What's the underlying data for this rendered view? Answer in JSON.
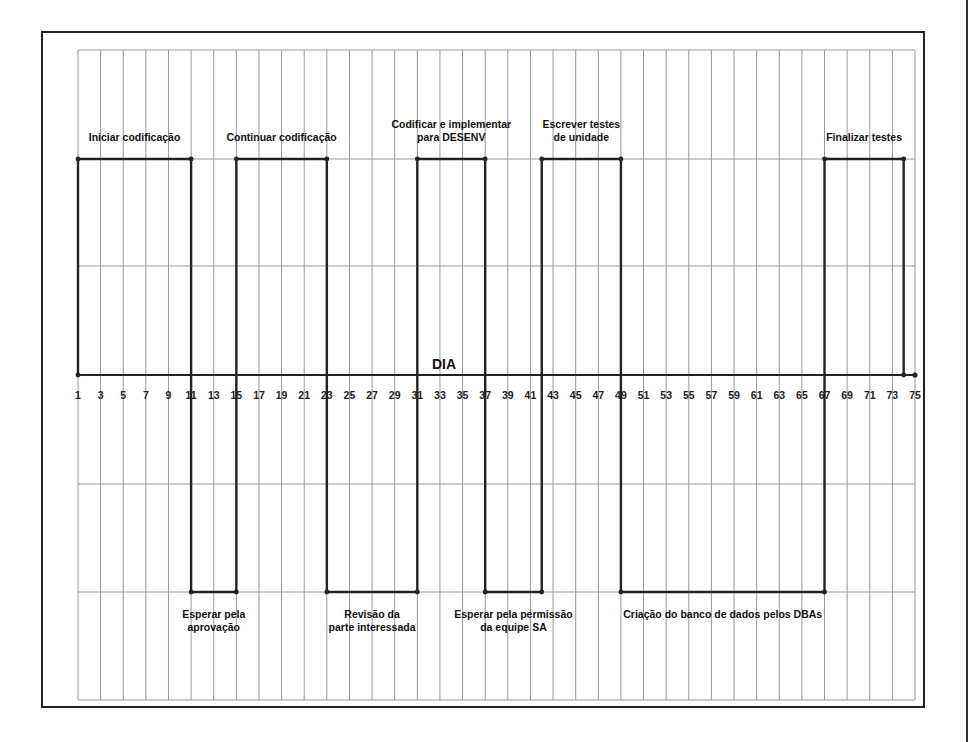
{
  "chart_data": {
    "type": "step-timeline",
    "title": "",
    "xlabel": "DIA",
    "ylabel": "",
    "x_range": [
      1,
      75
    ],
    "x_ticks": [
      1,
      3,
      5,
      7,
      9,
      11,
      13,
      15,
      17,
      19,
      21,
      23,
      25,
      27,
      29,
      31,
      33,
      35,
      37,
      39,
      41,
      43,
      45,
      47,
      49,
      51,
      53,
      55,
      57,
      59,
      61,
      63,
      65,
      67,
      69,
      71,
      73,
      75
    ],
    "levels": {
      "high": "trabalho ativo",
      "low": "espera / dependência"
    },
    "grid": true,
    "segments": [
      {
        "start": 1,
        "end": 11,
        "level": "high",
        "label": [
          "Iniciar codificação"
        ]
      },
      {
        "start": 11,
        "end": 15,
        "level": "low",
        "label": [
          "Esperar pela",
          "aprovação"
        ]
      },
      {
        "start": 15,
        "end": 23,
        "level": "high",
        "label": [
          "Continuar codificação"
        ]
      },
      {
        "start": 23,
        "end": 31,
        "level": "low",
        "label": [
          "Revisão da",
          "parte interessada"
        ]
      },
      {
        "start": 31,
        "end": 37,
        "level": "high",
        "label": [
          "Codificar e implementar",
          "para DESENV"
        ]
      },
      {
        "start": 37,
        "end": 42,
        "level": "low",
        "label": [
          "Esperar pela permissão",
          "da equipe SA"
        ]
      },
      {
        "start": 42,
        "end": 49,
        "level": "high",
        "label": [
          "Escrever testes",
          "de unidade"
        ]
      },
      {
        "start": 49,
        "end": 67,
        "level": "low",
        "label": [
          "Criação do banco de dados pelos DBAs"
        ]
      },
      {
        "start": 67,
        "end": 74,
        "level": "high",
        "label": [
          "Finalizar testes"
        ]
      }
    ],
    "end_point": 75
  },
  "colors": {
    "line": "#222222",
    "grid": "#999999",
    "frame": "#222222"
  }
}
